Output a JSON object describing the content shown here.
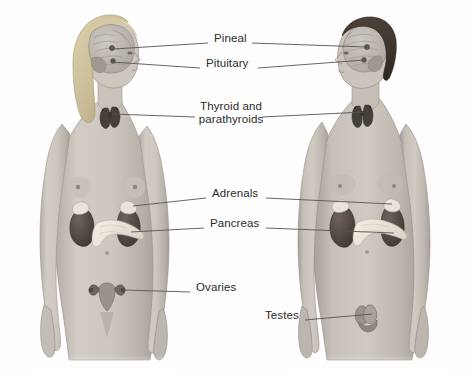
{
  "figure": {
    "background_color": "#fefefe",
    "label_color": "#2b2b2b",
    "leader_line_color": "#555555"
  },
  "subjects": [
    {
      "id": "female",
      "name": "female-figure",
      "facing": "right",
      "hair_color": "#c9bc96",
      "skin_color": "#c8c2bb"
    },
    {
      "id": "male",
      "name": "male-figure",
      "facing": "left",
      "hair_color": "#3a332c",
      "skin_color": "#c8c2bb"
    }
  ],
  "labels": [
    {
      "id": "pineal",
      "text": "Pineal",
      "x": 214,
      "y": 38,
      "align": "left"
    },
    {
      "id": "pituitary",
      "text": "Pituitary",
      "x": 206,
      "y": 62,
      "align": "left"
    },
    {
      "id": "thyroid",
      "text": "Thyroid and\nparathyroids",
      "x": 200,
      "y": 107,
      "align": "center"
    },
    {
      "id": "adrenals",
      "text": "Adrenals",
      "x": 212,
      "y": 192,
      "align": "left"
    },
    {
      "id": "pancreas",
      "text": "Pancreas",
      "x": 210,
      "y": 222,
      "align": "left"
    },
    {
      "id": "ovaries",
      "text": "Ovaries",
      "x": 196,
      "y": 286,
      "align": "left"
    },
    {
      "id": "testes",
      "text": "Testes",
      "x": 265,
      "y": 314,
      "align": "left"
    }
  ],
  "organs": [
    {
      "id": "brain",
      "label": "brain",
      "color": "#b4afa8"
    },
    {
      "id": "pineal",
      "label": "pineal-gland",
      "color": "#6b6560"
    },
    {
      "id": "pituitary",
      "label": "pituitary-gland",
      "color": "#6b6560"
    },
    {
      "id": "thyroid",
      "label": "thyroid-gland",
      "color": "#4a443e"
    },
    {
      "id": "adrenal",
      "label": "adrenal-gland",
      "color": "#e8e3d8"
    },
    {
      "id": "kidney",
      "label": "kidney",
      "color": "#4e4540"
    },
    {
      "id": "pancreas",
      "label": "pancreas",
      "color": "#ece7dc"
    },
    {
      "id": "ovary",
      "label": "ovary",
      "color": "#5a534d"
    },
    {
      "id": "uterus",
      "label": "uterus",
      "color": "#8e8780"
    },
    {
      "id": "testis",
      "label": "testis",
      "color": "#9a938c"
    }
  ]
}
